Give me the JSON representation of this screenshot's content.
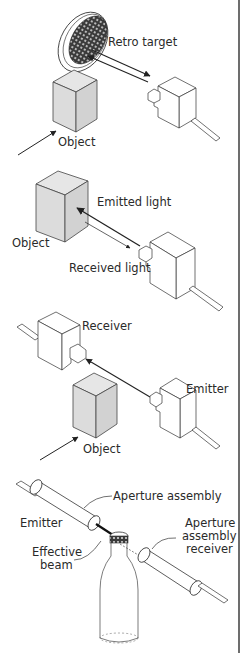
{
  "diagram": {
    "border_color": "#6d6d6d",
    "object_fill": "#dcdcdc",
    "line_color": "#222222",
    "panels": [
      {
        "id": "retro-reflective",
        "labels": {
          "target": "Retro target",
          "object": "Object"
        }
      },
      {
        "id": "diffuse",
        "labels": {
          "emitted": "Emitted light",
          "object": "Object",
          "received": "Received light"
        }
      },
      {
        "id": "through-beam",
        "labels": {
          "receiver": "Receiver",
          "emitter": "Emitter",
          "object": "Object"
        }
      },
      {
        "id": "aperture",
        "labels": {
          "aperture_assembly": "Aperture assembly",
          "emitter": "Emitter",
          "effective_line1": "Effective",
          "effective_line2": "beam",
          "receiver_line1": "Aperture",
          "receiver_line2": "assembly",
          "receiver_line3": "receiver"
        }
      }
    ]
  }
}
